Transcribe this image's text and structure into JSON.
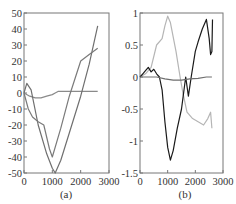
{
  "chart_data": [
    {
      "type": "line",
      "panel_label": "(a)",
      "title": "",
      "xlabel": "",
      "ylabel": "",
      "xlim": [
        0,
        3000
      ],
      "ylim": [
        -50,
        50
      ],
      "xticks": [
        "0",
        "1000",
        "2000",
        "3000"
      ],
      "yticks": [
        "50",
        "40",
        "30",
        "20",
        "10",
        "0",
        "-10",
        "-20",
        "-30",
        "-40",
        "-50"
      ],
      "grid": false,
      "legend": null,
      "series": [
        {
          "name": "curve-flat",
          "color": "#8a8a8a",
          "x": [
            0,
            200,
            400,
            600,
            800,
            1000,
            1100,
            1200,
            1500,
            2000,
            2600
          ],
          "y": [
            0,
            -2,
            -3,
            -3,
            -2,
            -1,
            0,
            1,
            1,
            1,
            1
          ]
        },
        {
          "name": "curve-peak-v",
          "color": "#6f6f6f",
          "x": [
            0,
            100,
            250,
            500,
            800,
            1000,
            1100,
            1300,
            1600,
            2000,
            2300,
            2600
          ],
          "y": [
            0,
            6,
            2,
            -20,
            -38,
            -47,
            -50,
            -42,
            -25,
            -2,
            18,
            42
          ]
        },
        {
          "name": "curve-steep-drop",
          "color": "#7a7a7a",
          "x": [
            0,
            150,
            300,
            500,
            700,
            900,
            1000,
            1300,
            1600,
            2000,
            2300,
            2600
          ],
          "y": [
            0,
            -10,
            -15,
            -18,
            -20,
            -35,
            -40,
            -22,
            -2,
            20,
            24,
            28
          ]
        }
      ]
    },
    {
      "type": "line",
      "panel_label": "(b)",
      "title": "",
      "xlabel": "",
      "ylabel": "",
      "xlim": [
        0,
        3000
      ],
      "ylim": [
        -1.5,
        1
      ],
      "xticks": [
        "0",
        "1000",
        "2000",
        "3000"
      ],
      "yticks": [
        "1",
        "0.5",
        "0",
        "-0.5",
        "-1",
        "-1.5"
      ],
      "grid": false,
      "legend": null,
      "series": [
        {
          "name": "light-grey",
          "color": "#b5b5b5",
          "x": [
            0,
            200,
            400,
            600,
            800,
            900,
            1000,
            1100,
            1300,
            1450,
            1550,
            1700,
            1900,
            2100,
            2300,
            2450,
            2550,
            2600
          ],
          "y": [
            0,
            0.05,
            0.15,
            0.5,
            0.6,
            0.8,
            0.95,
            0.85,
            0.4,
            0.0,
            -0.25,
            -0.55,
            -0.65,
            -0.7,
            -0.75,
            -0.65,
            -0.55,
            -0.8
          ]
        },
        {
          "name": "black",
          "color": "#1a1a1a",
          "x": [
            0,
            100,
            200,
            300,
            400,
            500,
            600,
            700,
            800,
            900,
            1000,
            1100,
            1200,
            1350,
            1500,
            1650,
            1750,
            1850,
            2000,
            2100,
            2250,
            2400,
            2500,
            2550,
            2600,
            2620
          ],
          "y": [
            0,
            0.05,
            0.1,
            0.15,
            0.08,
            0.12,
            0.05,
            0.0,
            -0.2,
            -0.7,
            -1.1,
            -1.3,
            -1.15,
            -0.8,
            -0.5,
            0.0,
            -0.3,
            0.0,
            0.4,
            0.55,
            0.75,
            0.9,
            0.6,
            0.35,
            0.4,
            0.9
          ]
        },
        {
          "name": "medium-grey-flat",
          "color": "#6e6e6e",
          "x": [
            0,
            300,
            600,
            900,
            1200,
            1500,
            1800,
            2100,
            2400,
            2600
          ],
          "y": [
            0,
            0.0,
            0.0,
            -0.03,
            -0.05,
            -0.05,
            -0.03,
            -0.02,
            0.0,
            0.0
          ]
        }
      ]
    }
  ]
}
